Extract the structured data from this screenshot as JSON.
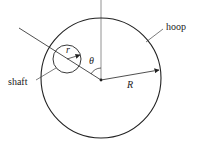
{
  "diagram": {
    "labels": {
      "hoop": "hoop",
      "shaft": "shaft",
      "R": "R",
      "r": "r",
      "theta": "θ"
    },
    "colors": {
      "stroke": "#222222",
      "axis": "#666666",
      "background": "#ffffff"
    }
  }
}
